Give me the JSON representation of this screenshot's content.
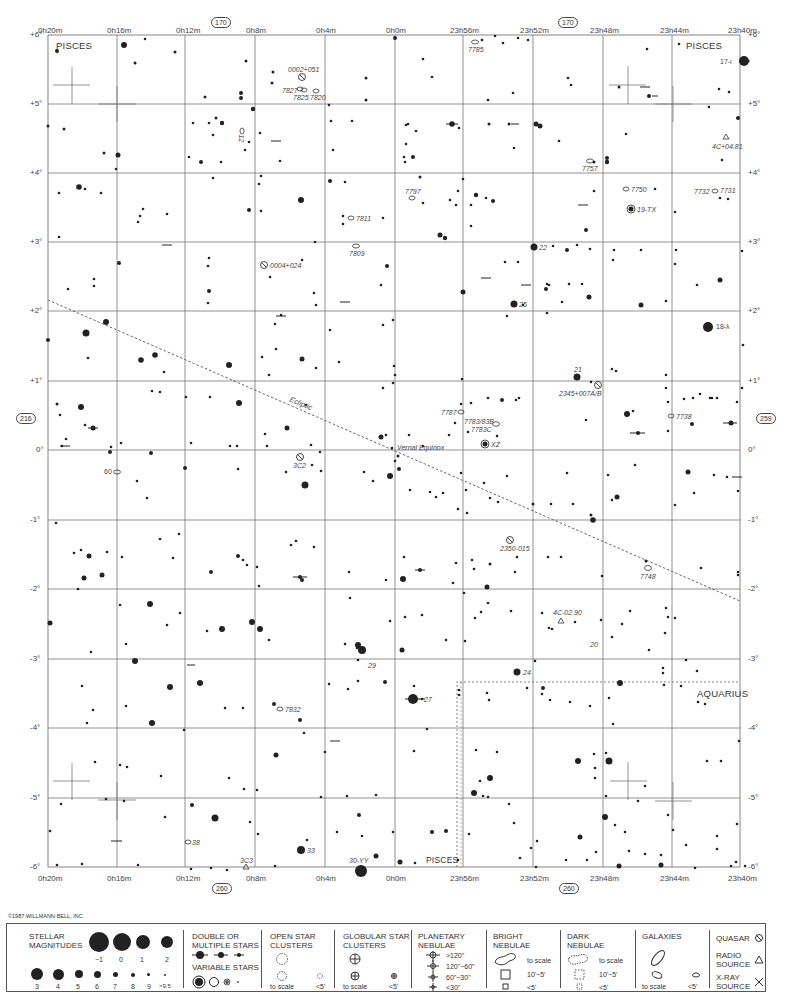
{
  "chart_page": {
    "constellations": [
      "PISCES",
      "PISCES",
      "AQUARIUS",
      "PISCES"
    ],
    "page_refs": {
      "top_left": "170",
      "top_right": "170",
      "left": "216",
      "right": "259",
      "bottom_left": "260",
      "bottom_right": "260"
    },
    "ra_labels": [
      "0h20m",
      "0h16m",
      "0h12m",
      "0h8m",
      "0h4m",
      "0h0m",
      "23h56m",
      "23h52m",
      "23h48m",
      "23h44m",
      "23h40m"
    ],
    "dec_labels": [
      "+6°",
      "+5°",
      "+4°",
      "+3°",
      "+2°",
      "+1°",
      "0°",
      "-1°",
      "-2°",
      "-3°",
      "-4°",
      "-5°",
      "-6°"
    ],
    "ecliptic_label": "Ecliptic",
    "vernal_equinox_label": "Vernal Equinox",
    "ecliptic_ticks": [
      "5°",
      "4°",
      "3°",
      "2°",
      "1°",
      "0°",
      "359°",
      "358°",
      "357°",
      "356°",
      "355°"
    ],
    "objects": [
      {
        "label": "0002+051",
        "type": "quasar"
      },
      {
        "label": "7827",
        "type": "galaxy"
      },
      {
        "label": "7825",
        "type": "galaxy"
      },
      {
        "label": "7820",
        "type": "galaxy"
      },
      {
        "label": "7785",
        "type": "galaxy"
      },
      {
        "label": "17-ι",
        "type": "star"
      },
      {
        "label": "12",
        "type": "galaxy"
      },
      {
        "label": "4C+04.81",
        "type": "radio-source"
      },
      {
        "label": "7757",
        "type": "galaxy"
      },
      {
        "label": "7797",
        "type": "galaxy"
      },
      {
        "label": "7811",
        "type": "galaxy"
      },
      {
        "label": "7809",
        "type": "galaxy"
      },
      {
        "label": "7750",
        "type": "galaxy"
      },
      {
        "label": "19-TX",
        "type": "variable-star"
      },
      {
        "label": "7732",
        "type": "galaxy"
      },
      {
        "label": "7731",
        "type": "galaxy"
      },
      {
        "label": "0004+024",
        "type": "quasar"
      },
      {
        "label": "22",
        "type": "star"
      },
      {
        "label": "25",
        "type": "star"
      },
      {
        "label": "18-λ",
        "type": "star"
      },
      {
        "label": "21",
        "type": "star"
      },
      {
        "label": "2345+007A/B",
        "type": "quasar"
      },
      {
        "label": "7787",
        "type": "galaxy"
      },
      {
        "label": "7783/83B",
        "type": "galaxy"
      },
      {
        "label": "7783C",
        "type": "galaxy"
      },
      {
        "label": "XZ",
        "type": "variable-star"
      },
      {
        "label": "7738",
        "type": "galaxy"
      },
      {
        "label": "60",
        "type": "galaxy"
      },
      {
        "label": "3C2",
        "type": "quasar"
      },
      {
        "label": "2350-015",
        "type": "quasar"
      },
      {
        "label": "7748",
        "type": "galaxy"
      },
      {
        "label": "4C-02.90",
        "type": "radio-source"
      },
      {
        "label": "20",
        "type": "star"
      },
      {
        "label": "24",
        "type": "star"
      },
      {
        "label": "29",
        "type": "star"
      },
      {
        "label": "27",
        "type": "star"
      },
      {
        "label": "7832",
        "type": "galaxy"
      },
      {
        "label": "38",
        "type": "galaxy"
      },
      {
        "label": "33",
        "type": "star"
      },
      {
        "label": "3C3",
        "type": "radio-source"
      },
      {
        "label": "30-YY",
        "type": "variable-star"
      }
    ]
  },
  "copyright": "©1987 WILLMANN-BELL, INC.",
  "legend": {
    "stellar_magnitudes": {
      "title": "STELLAR MAGNITUDES",
      "row1": [
        "−1",
        "0",
        "1",
        "2"
      ],
      "row2": [
        "3",
        "4",
        "5",
        "6",
        "7",
        "8",
        "9",
        ">9.5"
      ]
    },
    "double_stars": {
      "title": "DOUBLE OR MULTIPLE STARS"
    },
    "variable_stars": {
      "title": "VARIABLE STARS"
    },
    "open_clusters": {
      "title": "OPEN STAR CLUSTERS",
      "to_scale": "to scale",
      "small": "<5'"
    },
    "globular_clusters": {
      "title": "GLOBULAR STAR CLUSTERS",
      "to_scale": "to scale",
      "small": "<5'"
    },
    "planetary_nebulae": {
      "title": "PLANETARY NEBULAE",
      "sizes": [
        ">120\"",
        "120\"−60\"",
        "60\"−30\"",
        "<30\""
      ]
    },
    "bright_nebulae": {
      "title": "BRIGHT NEBULAE",
      "sizes": [
        "to scale",
        "10'−5'",
        "<5'"
      ]
    },
    "dark_nebulae": {
      "title": "DARK NEBULAE",
      "sizes": [
        "to scale",
        "10'−5'",
        "<5'"
      ]
    },
    "galaxies": {
      "title": "GALAXIES",
      "to_scale": "to scale",
      "small": "<5'"
    },
    "quasar": {
      "title": "QUASAR"
    },
    "radio_source": {
      "title": "RADIO SOURCE"
    },
    "xray_source": {
      "title": "X-RAY SOURCE"
    }
  }
}
